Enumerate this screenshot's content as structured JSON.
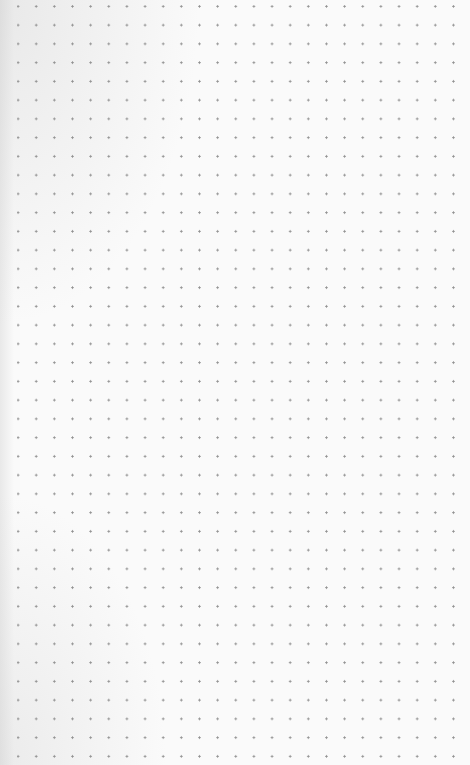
{
  "canvas": {
    "type": "dot-grid-paper",
    "columns": 25,
    "rows": 41,
    "dot_spacing_x_px": 18.15,
    "dot_spacing_y_px": 18.75,
    "dot_color": "#8f8f8f",
    "background_color": "#fafafa"
  }
}
